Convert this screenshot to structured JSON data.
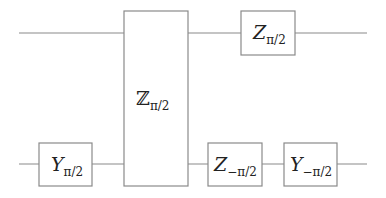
{
  "diagram": {
    "type": "quantum-circuit",
    "wires": [
      {
        "id": "wire-1",
        "y": 33,
        "x_start": 19,
        "x_end": 367
      },
      {
        "id": "wire-2",
        "y": 164,
        "x_start": 19,
        "x_end": 367
      }
    ],
    "gates": [
      {
        "id": "gate-y-pi-2",
        "symbol": "Y",
        "subscript": "π/2",
        "wire": 2,
        "x": 39,
        "y": 143,
        "w": 53,
        "h": 43
      },
      {
        "id": "gate-zz-pi-2",
        "symbol": "ℤ",
        "subscript": "π/2",
        "wires": [
          1,
          2
        ],
        "x": 124,
        "y": 11,
        "w": 64,
        "h": 175
      },
      {
        "id": "gate-z-pi-2",
        "symbol": "Z",
        "subscript": "π/2",
        "wire": 1,
        "x": 241,
        "y": 11,
        "w": 54,
        "h": 44
      },
      {
        "id": "gate-z-neg-pi-2",
        "symbol": "Z",
        "subscript": "−π/2",
        "wire": 2,
        "x": 208,
        "y": 143,
        "w": 54,
        "h": 43
      },
      {
        "id": "gate-y-neg-pi-2",
        "symbol": "Y",
        "subscript": "−π/2",
        "wire": 2,
        "x": 284,
        "y": 143,
        "w": 53,
        "h": 43
      }
    ],
    "colors": {
      "line": "#8a8a8a",
      "text": "#222222",
      "background": "#ffffff"
    }
  }
}
